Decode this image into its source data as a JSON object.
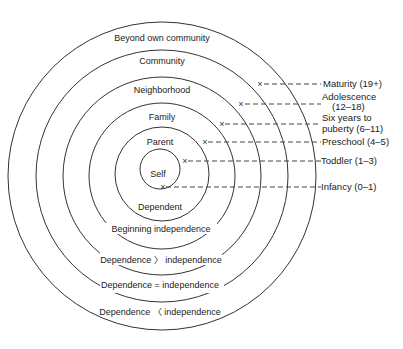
{
  "diagram": {
    "center": {
      "x": 162,
      "y": 176
    },
    "rings": [
      {
        "name": "self",
        "radius": 20
      },
      {
        "name": "parent",
        "radius": 47
      },
      {
        "name": "family",
        "radius": 73
      },
      {
        "name": "neighborhood",
        "radius": 99
      },
      {
        "name": "community",
        "radius": 126
      },
      {
        "name": "beyond-own-community",
        "radius": 154
      }
    ],
    "top_labels": {
      "beyond": "Beyond own community",
      "community": "Community",
      "neighborhood": "Neighborhood",
      "family": "Family",
      "parent": "Parent",
      "self": "Self"
    },
    "bottom_labels": {
      "dependent": "Dependent",
      "beginning": "Beginning independence",
      "greater": "Dependence 〉 independence",
      "equal": "Dependence = independence",
      "less": "Dependence 〈 independence"
    },
    "stages": {
      "maturity": "Maturity (19+)",
      "adolescence_1": "Adolescence",
      "adolescence_2": "(12–18)",
      "six_years_1": "Six years to",
      "six_years_2": "puberty (6–11)",
      "preschool": "Preschool (4–5)",
      "toddler": "Toddler (1–3)",
      "infancy": "Infancy (0–1)"
    },
    "marker_glyph": "×",
    "line_color": "#333333",
    "background": "#ffffff"
  }
}
